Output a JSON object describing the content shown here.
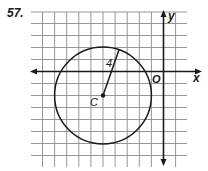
{
  "problem": {
    "number": "57."
  },
  "axes": {
    "x_label": "x",
    "y_label": "y",
    "origin_label": "O"
  },
  "circle": {
    "center_label": "C",
    "radius_label": "4",
    "center": [
      -5,
      -2
    ],
    "radius": 4
  },
  "grid": {
    "x_range": [
      -11,
      1
    ],
    "y_range": [
      -8,
      5
    ],
    "spacing": 1
  },
  "colors": {
    "grid": "#8a8a8a",
    "stroke": "#1a1a1a",
    "background": "#ffffff"
  }
}
